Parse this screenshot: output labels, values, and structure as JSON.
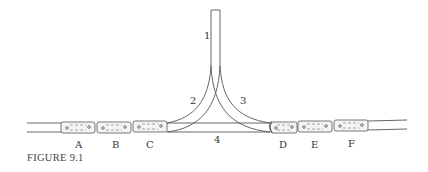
{
  "figure": {
    "caption": "FIGURE 9.1",
    "track_labels": [
      {
        "id": "1",
        "text": "1"
      },
      {
        "id": "2",
        "text": "2"
      },
      {
        "id": "3",
        "text": "3"
      },
      {
        "id": "4",
        "text": "4"
      }
    ],
    "cars": [
      {
        "label": "A"
      },
      {
        "label": "B"
      },
      {
        "label": "C"
      },
      {
        "label": "D"
      },
      {
        "label": "E"
      },
      {
        "label": "F"
      }
    ],
    "colors": {
      "line": "#555555",
      "car_fill": "#f4f4f4",
      "text": "#333333"
    }
  }
}
